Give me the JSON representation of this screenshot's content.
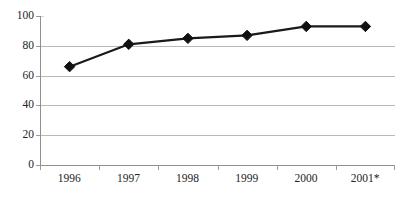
{
  "chart_data": {
    "type": "line",
    "title": "",
    "subtitle": "",
    "xlabel": "",
    "ylabel": "",
    "categories": [
      "1996",
      "1997",
      "1998",
      "1999",
      "2000",
      "2001*"
    ],
    "values": [
      66,
      81,
      85,
      87,
      93,
      93
    ],
    "series": [
      {
        "name": "",
        "values": [
          66,
          81,
          85,
          87,
          93,
          93
        ]
      }
    ],
    "ylim": [
      0,
      100
    ],
    "y_ticks": [
      0,
      20,
      40,
      60,
      80,
      100
    ],
    "y_tick_labels": [
      "0",
      "20",
      "40",
      "60",
      "80",
      "100"
    ],
    "grid": true,
    "grid_axis": "y",
    "legend": false,
    "legend_position": "none",
    "marker": "diamond",
    "annotations": [],
    "colors": {
      "line": "#1a1a1a",
      "marker": "#111111",
      "gridline": "#b9b9b9",
      "axis": "#8f8f8f",
      "text": "#242424",
      "background": "#ffffff"
    }
  },
  "axes": {
    "y_tick_labels": [
      "100",
      "80",
      "60",
      "40",
      "20",
      "0"
    ],
    "x_tick_labels": [
      "1996",
      "1997",
      "1998",
      "1999",
      "2000",
      "2001*"
    ]
  }
}
